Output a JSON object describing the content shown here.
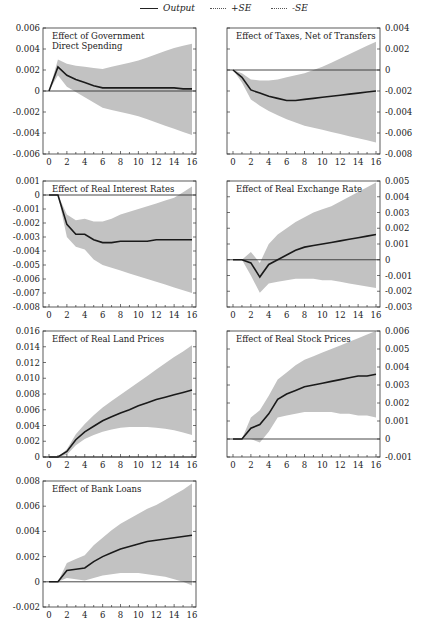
{
  "legend": {
    "items": [
      {
        "label": "Output",
        "style": "solid"
      },
      {
        "label": "+SE",
        "style": "dotted"
      },
      {
        "label": "-SE",
        "style": "dotted"
      }
    ]
  },
  "colors": {
    "band": "#c2c2c2",
    "line": "#1a1a1a",
    "frame": "#333333",
    "zero": "#333333"
  },
  "chart_data": [
    {
      "type": "line",
      "title": "Effect of Government\nDirect Spending",
      "xlabel": "",
      "ylabel": "",
      "axis_side": "left",
      "x": [
        0,
        1,
        2,
        3,
        4,
        5,
        6,
        7,
        8,
        9,
        10,
        11,
        12,
        13,
        14,
        15,
        16
      ],
      "xticks": [
        0,
        2,
        4,
        6,
        8,
        10,
        12,
        14,
        16
      ],
      "ylim": [
        -0.006,
        0.006
      ],
      "yticks": [
        "0.006",
        "0.004",
        "0.002",
        "0",
        "-0.002",
        "-0.004",
        "-0.006"
      ],
      "series": [
        {
          "name": "Output",
          "values": [
            0,
            0.0023,
            0.0015,
            0.0011,
            0.0008,
            0.0005,
            0.0003,
            0.0003,
            0.0003,
            0.0003,
            0.0003,
            0.0003,
            0.0003,
            0.0003,
            0.0003,
            0.0002,
            0.0002
          ]
        },
        {
          "name": "+SE",
          "values": [
            0,
            0.003,
            0.0026,
            0.0024,
            0.0023,
            0.0022,
            0.0021,
            0.0023,
            0.0025,
            0.0027,
            0.0029,
            0.0032,
            0.0035,
            0.0038,
            0.0041,
            0.0043,
            0.0045
          ]
        },
        {
          "name": "-SE",
          "values": [
            0,
            0.0015,
            0.0004,
            -0.0001,
            -0.0006,
            -0.0011,
            -0.0016,
            -0.0018,
            -0.002,
            -0.0022,
            -0.0024,
            -0.0027,
            -0.003,
            -0.0033,
            -0.0036,
            -0.0039,
            -0.0042
          ]
        }
      ]
    },
    {
      "type": "line",
      "title": "Effect of Taxes, Net of Transfers",
      "xlabel": "",
      "ylabel": "",
      "axis_side": "right",
      "x": [
        0,
        1,
        2,
        3,
        4,
        5,
        6,
        7,
        8,
        9,
        10,
        11,
        12,
        13,
        14,
        15,
        16
      ],
      "xticks": [
        0,
        2,
        4,
        6,
        8,
        10,
        12,
        14,
        16
      ],
      "ylim": [
        -0.008,
        0.004
      ],
      "yticks": [
        "0.004",
        "0.002",
        "0",
        "-0.002",
        "-0.004",
        "-0.006",
        "-0.008"
      ],
      "series": [
        {
          "name": "Output",
          "values": [
            0,
            -0.0007,
            -0.0019,
            -0.0022,
            -0.0025,
            -0.0027,
            -0.0029,
            -0.0029,
            -0.0028,
            -0.0027,
            -0.0026,
            -0.0025,
            -0.0024,
            -0.0023,
            -0.0022,
            -0.0021,
            -0.002
          ]
        },
        {
          "name": "+SE",
          "values": [
            0,
            -0.0003,
            -0.0009,
            -0.001,
            -0.001,
            -0.0009,
            -0.0007,
            -0.0005,
            -0.0003,
            0.0,
            0.0003,
            0.0007,
            0.0011,
            0.0015,
            0.0019,
            0.0023,
            0.0027
          ]
        },
        {
          "name": "-SE",
          "values": [
            0,
            -0.0012,
            -0.0028,
            -0.0034,
            -0.0039,
            -0.0043,
            -0.0047,
            -0.005,
            -0.0053,
            -0.0055,
            -0.0057,
            -0.0059,
            -0.0061,
            -0.0063,
            -0.0065,
            -0.0067,
            -0.0069
          ]
        }
      ]
    },
    {
      "type": "line",
      "title": "Effect of Real Interest Rates",
      "xlabel": "",
      "ylabel": "",
      "axis_side": "left",
      "x": [
        0,
        1,
        2,
        3,
        4,
        5,
        6,
        7,
        8,
        9,
        10,
        11,
        12,
        13,
        14,
        15,
        16
      ],
      "xticks": [
        0,
        2,
        4,
        6,
        8,
        10,
        12,
        14,
        16
      ],
      "ylim": [
        -0.008,
        0.001
      ],
      "yticks": [
        "0.001",
        "0",
        "-0.001",
        "-0.002",
        "-0.003",
        "-0.004",
        "-0.005",
        "-0.006",
        "-0.007",
        "-0.008"
      ],
      "series": [
        {
          "name": "Output",
          "values": [
            0,
            0,
            -0.0021,
            -0.0028,
            -0.0028,
            -0.0032,
            -0.0034,
            -0.0034,
            -0.0033,
            -0.0033,
            -0.0033,
            -0.0033,
            -0.0032,
            -0.0032,
            -0.0032,
            -0.0032,
            -0.0032
          ]
        },
        {
          "name": "+SE",
          "values": [
            0,
            0,
            -0.0014,
            -0.0018,
            -0.0017,
            -0.0019,
            -0.0019,
            -0.0017,
            -0.0014,
            -0.0012,
            -0.001,
            -0.0008,
            -0.0006,
            -0.0004,
            -0.0002,
            0.0002,
            0.0006
          ]
        },
        {
          "name": "-SE",
          "values": [
            0,
            0,
            -0.003,
            -0.0037,
            -0.0039,
            -0.0046,
            -0.005,
            -0.0052,
            -0.0054,
            -0.0056,
            -0.0058,
            -0.006,
            -0.0062,
            -0.0064,
            -0.0066,
            -0.0068,
            -0.007
          ]
        }
      ]
    },
    {
      "type": "line",
      "title": "Effect of Real Exchange Rate",
      "xlabel": "",
      "ylabel": "",
      "axis_side": "right",
      "x": [
        0,
        1,
        2,
        3,
        4,
        5,
        6,
        7,
        8,
        9,
        10,
        11,
        12,
        13,
        14,
        15,
        16
      ],
      "xticks": [
        0,
        2,
        4,
        6,
        8,
        10,
        12,
        14,
        16
      ],
      "ylim": [
        -0.003,
        0.005
      ],
      "yticks": [
        "0.005",
        "0.004",
        "0.003",
        "0.002",
        "0.001",
        "0",
        "-0.001",
        "-0.002",
        "-0.003"
      ],
      "series": [
        {
          "name": "Output",
          "values": [
            0,
            0,
            -0.0002,
            -0.0011,
            -0.0003,
            0.0,
            0.0003,
            0.0006,
            0.0008,
            0.0009,
            0.001,
            0.0011,
            0.0012,
            0.0013,
            0.0014,
            0.0015,
            0.0016
          ]
        },
        {
          "name": "+SE",
          "values": [
            0,
            0,
            0.0005,
            -0.0002,
            0.001,
            0.0016,
            0.002,
            0.0024,
            0.0027,
            0.003,
            0.0032,
            0.0034,
            0.0037,
            0.004,
            0.0043,
            0.0046,
            0.0049
          ]
        },
        {
          "name": "-SE",
          "values": [
            0,
            0,
            -0.001,
            -0.0021,
            -0.0015,
            -0.0014,
            -0.0013,
            -0.0012,
            -0.0012,
            -0.0012,
            -0.0013,
            -0.0013,
            -0.0014,
            -0.0015,
            -0.0016,
            -0.0017,
            -0.0018
          ]
        }
      ]
    },
    {
      "type": "line",
      "title": "Effect of Real Land Prices",
      "xlabel": "",
      "ylabel": "",
      "axis_side": "left",
      "x": [
        0,
        1,
        2,
        3,
        4,
        5,
        6,
        7,
        8,
        9,
        10,
        11,
        12,
        13,
        14,
        15,
        16
      ],
      "xticks": [
        0,
        2,
        4,
        6,
        8,
        10,
        12,
        14,
        16
      ],
      "ylim": [
        0,
        0.016
      ],
      "yticks": [
        "0.016",
        "0.014",
        "0.012",
        "0.010",
        "0.008",
        "0.006",
        "0.004",
        "0.002",
        "0"
      ],
      "series": [
        {
          "name": "Output",
          "values": [
            0,
            0,
            0.0007,
            0.0022,
            0.0032,
            0.0039,
            0.0046,
            0.0051,
            0.0056,
            0.006,
            0.0065,
            0.0069,
            0.0073,
            0.0076,
            0.0079,
            0.0082,
            0.0085
          ]
        },
        {
          "name": "+SE",
          "values": [
            0,
            0,
            0.001,
            0.0029,
            0.0042,
            0.0053,
            0.0063,
            0.0071,
            0.0079,
            0.0087,
            0.0095,
            0.0103,
            0.0111,
            0.0119,
            0.0127,
            0.0134,
            0.0142
          ]
        },
        {
          "name": "-SE",
          "values": [
            0,
            0,
            0.0003,
            0.0015,
            0.0023,
            0.0028,
            0.0032,
            0.0035,
            0.0037,
            0.0038,
            0.0038,
            0.0038,
            0.0037,
            0.0036,
            0.0034,
            0.0031,
            0.0028
          ]
        }
      ]
    },
    {
      "type": "line",
      "title": "Effect of Real Stock Prices",
      "xlabel": "",
      "ylabel": "",
      "axis_side": "right",
      "x": [
        0,
        1,
        2,
        3,
        4,
        5,
        6,
        7,
        8,
        9,
        10,
        11,
        12,
        13,
        14,
        15,
        16
      ],
      "xticks": [
        0,
        2,
        4,
        6,
        8,
        10,
        12,
        14,
        16
      ],
      "ylim": [
        -0.001,
        0.006
      ],
      "yticks": [
        "0.006",
        "0.005",
        "0.004",
        "0.003",
        "0.002",
        "0.001",
        "0",
        "-0.001"
      ],
      "series": [
        {
          "name": "Output",
          "values": [
            0,
            0,
            0.0006,
            0.0008,
            0.0014,
            0.0022,
            0.0025,
            0.0027,
            0.0029,
            0.003,
            0.0031,
            0.0032,
            0.0033,
            0.0034,
            0.0035,
            0.0035,
            0.0036
          ]
        },
        {
          "name": "+SE",
          "values": [
            0,
            0,
            0.0012,
            0.0016,
            0.0024,
            0.0033,
            0.0037,
            0.0041,
            0.0044,
            0.0046,
            0.0048,
            0.005,
            0.0052,
            0.0054,
            0.0056,
            0.0058,
            0.006
          ]
        },
        {
          "name": "-SE",
          "values": [
            0,
            0,
            0.0,
            -0.0002,
            0.0004,
            0.0012,
            0.0013,
            0.0014,
            0.0015,
            0.0015,
            0.0015,
            0.0015,
            0.0014,
            0.0014,
            0.0013,
            0.0013,
            0.0012
          ]
        }
      ]
    },
    {
      "type": "line",
      "title": "Effect of Bank Loans",
      "xlabel": "",
      "ylabel": "",
      "axis_side": "left",
      "x": [
        0,
        1,
        2,
        3,
        4,
        5,
        6,
        7,
        8,
        9,
        10,
        11,
        12,
        13,
        14,
        15,
        16
      ],
      "xticks": [
        0,
        2,
        4,
        6,
        8,
        10,
        12,
        14,
        16
      ],
      "ylim": [
        -0.002,
        0.008
      ],
      "yticks": [
        "0.008",
        "0.006",
        "0.004",
        "0.002",
        "0",
        "-0.002"
      ],
      "series": [
        {
          "name": "Output",
          "values": [
            0,
            0,
            0.0009,
            0.001,
            0.0011,
            0.0016,
            0.002,
            0.0023,
            0.0026,
            0.0028,
            0.003,
            0.0032,
            0.0033,
            0.0034,
            0.0035,
            0.0036,
            0.0037
          ]
        },
        {
          "name": "+SE",
          "values": [
            0,
            0,
            0.0015,
            0.0018,
            0.0021,
            0.0029,
            0.0035,
            0.0041,
            0.0046,
            0.005,
            0.0054,
            0.0058,
            0.0061,
            0.0065,
            0.0069,
            0.0073,
            0.0078
          ]
        },
        {
          "name": "-SE",
          "values": [
            0,
            0,
            0.0003,
            0.0002,
            0.0001,
            0.0003,
            0.0005,
            0.0006,
            0.0007,
            0.0007,
            0.0007,
            0.0006,
            0.0005,
            0.0004,
            0.0002,
            0.0,
            -0.0003
          ]
        }
      ]
    }
  ]
}
